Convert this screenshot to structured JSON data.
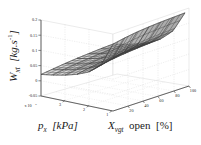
{
  "figure": {
    "type": "3d-surface-mesh",
    "background": "#ffffff",
    "mesh_color": "#3a3a3a",
    "grid_color": "#cccccc",
    "axis_color": "#4a4a4a"
  },
  "axes": {
    "x": {
      "label_main": "p",
      "label_sub": "x",
      "label_unit": "[kPa]",
      "label_full": "p_x [kPa]",
      "ticks": [
        "1",
        "2",
        "3"
      ],
      "tick_values": [
        1,
        2,
        3
      ],
      "exponent": "x 10",
      "exponent_power": "5",
      "range": [
        0.5,
        3.5
      ]
    },
    "y": {
      "label_main": "X",
      "label_sub": "vgt",
      "label_word": "open",
      "label_unit": "[%]",
      "label_full": "X_vgt open [%]",
      "ticks": [
        "20",
        "40",
        "60",
        "80",
        "100"
      ],
      "tick_values": [
        20,
        40,
        60,
        80,
        100
      ],
      "range": [
        10,
        105
      ]
    },
    "z": {
      "label_main": "W",
      "label_sub": "xt",
      "label_unit": "[kg.s",
      "label_unit_exp": "-1",
      "label_unit_close": "]",
      "label_full": "W_xt [kg.s^-1]",
      "ticks": [
        "0.2",
        "0.15",
        "0.1",
        "0.05",
        "0",
        "-0.05"
      ],
      "tick_values": [
        0.2,
        0.15,
        0.1,
        0.05,
        0,
        -0.05
      ],
      "range": [
        -0.05,
        0.2
      ]
    }
  },
  "chart_data": {
    "type": "surface",
    "title": "",
    "xlabel": "p_x [kPa]",
    "ylabel": "X_vgt open [%]",
    "zlabel": "W_xt [kg.s^-1]",
    "xlim": [
      0.5,
      3.5
    ],
    "ylim": [
      10,
      105
    ],
    "zlim": [
      -0.05,
      0.2
    ],
    "x_exponent": 5,
    "grid": true,
    "legend": "none",
    "x": [
      0.5,
      1.0,
      1.5,
      2.0,
      2.5,
      3.0,
      3.5
    ],
    "y": [
      10,
      25,
      40,
      55,
      70,
      85,
      100
    ],
    "z_note": "W_xt rises steeply as p_x decreases toward low pressure and as X_vgt open increases; flat saturated plateau over most of the domain.",
    "z": [
      [
        0.17,
        0.178,
        0.184,
        0.188,
        0.191,
        0.193,
        0.195
      ],
      [
        0.092,
        0.104,
        0.112,
        0.118,
        0.122,
        0.125,
        0.127
      ],
      [
        0.062,
        0.072,
        0.079,
        0.084,
        0.088,
        0.091,
        0.093
      ],
      [
        0.046,
        0.054,
        0.06,
        0.065,
        0.068,
        0.071,
        0.073
      ],
      [
        0.035,
        0.042,
        0.047,
        0.052,
        0.055,
        0.058,
        0.06
      ],
      [
        0.027,
        0.033,
        0.038,
        0.042,
        0.046,
        0.048,
        0.05
      ],
      [
        0.021,
        0.026,
        0.031,
        0.035,
        0.038,
        0.041,
        0.043
      ]
    ]
  }
}
